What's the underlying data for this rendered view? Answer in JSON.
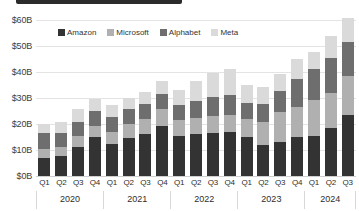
{
  "topbar": {
    "present": true
  },
  "chart_data": {
    "type": "bar",
    "subtype": "stacked-bar",
    "title": "",
    "xlabel": "",
    "ylabel": "",
    "ylim": [
      0,
      60
    ],
    "yticks": [
      60,
      50,
      40,
      30,
      20,
      10,
      0
    ],
    "ytick_labels": [
      "$60B",
      "$50B",
      "$40B",
      "$30B",
      "$20B",
      "$10B",
      "$0B"
    ],
    "grid": true,
    "legend_position": "top-left",
    "units": "USD billions",
    "categories": [
      "Q1",
      "Q2",
      "Q3",
      "Q4",
      "Q1",
      "Q2",
      "Q3",
      "Q4",
      "Q1",
      "Q2",
      "Q3",
      "Q4",
      "Q1",
      "Q2",
      "Q3",
      "Q4",
      "Q1",
      "Q2",
      "Q3"
    ],
    "year_groups": [
      {
        "label": "2020",
        "count": 4
      },
      {
        "label": "2021",
        "count": 4
      },
      {
        "label": "2022",
        "count": 4
      },
      {
        "label": "2023",
        "count": 4
      },
      {
        "label": "2024",
        "count": 3
      }
    ],
    "series": [
      {
        "name": "Amazon",
        "color": "#333333",
        "values": [
          6.8,
          7.8,
          11.2,
          15.1,
          12.4,
          14.8,
          16.0,
          19.3,
          15.3,
          16.0,
          16.6,
          16.8,
          14.9,
          11.9,
          13.0,
          15.0,
          15.4,
          18.3,
          23.4
        ]
      },
      {
        "name": "Microsoft",
        "color": "#b0b0b0",
        "values": [
          3.6,
          3.2,
          4.3,
          4.3,
          4.4,
          5.4,
          5.9,
          6.3,
          6.4,
          6.2,
          6.4,
          6.8,
          7.0,
          8.9,
          11.5,
          11.5,
          13.9,
          13.8,
          14.9
        ]
      },
      {
        "name": "Alphabet",
        "color": "#6e6e6e",
        "values": [
          6.0,
          5.4,
          5.4,
          5.5,
          5.9,
          5.4,
          5.8,
          5.9,
          5.8,
          6.8,
          7.3,
          7.7,
          6.3,
          6.9,
          8.1,
          11.0,
          12.0,
          13.2,
          13.1
        ]
      },
      {
        "name": "Meta",
        "color": "#dadada",
        "values": [
          3.6,
          4.2,
          4.7,
          4.6,
          4.8,
          4.6,
          4.5,
          5.2,
          5.5,
          7.5,
          9.5,
          9.8,
          6.8,
          6.4,
          6.5,
          7.7,
          6.4,
          8.5,
          9.2
        ]
      }
    ]
  }
}
